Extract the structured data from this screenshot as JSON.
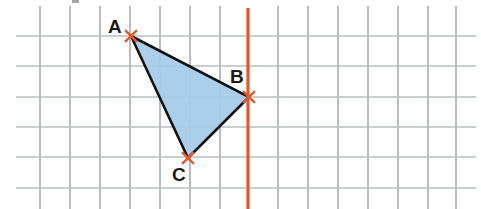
{
  "figure": {
    "canvas": {
      "width": 481,
      "height": 209,
      "background": "#ffffff"
    },
    "grid": {
      "cell_size": 30,
      "origin_x": 40,
      "origin_y": 36,
      "color_vertical": "#b9bcc0",
      "color_horizontal": "#c9ced1",
      "line_width": 1.1,
      "vertical_x": [
        40,
        70,
        100,
        130,
        160,
        190,
        220,
        278,
        308,
        338,
        368,
        398,
        428,
        456
      ],
      "horizontal_y": [
        36,
        66,
        97,
        127,
        157,
        188
      ],
      "h_extent": [
        16,
        476
      ],
      "v_extent": [
        6,
        209
      ]
    },
    "mirror_line": {
      "label": "mirror-line",
      "x": 248,
      "y_start": 8,
      "y_end": 209,
      "color": "#e8562a",
      "width": 3.2
    },
    "triangle": {
      "fill": "#a7cbe9",
      "fill_opacity": 0.95,
      "stroke": "#111111",
      "stroke_width": 2.6,
      "vertices": [
        {
          "name": "A",
          "x": 131,
          "y": 36,
          "label_x": 108,
          "label_y": 33
        },
        {
          "name": "B",
          "x": 249,
          "y": 97,
          "label_x": 230,
          "label_y": 83
        },
        {
          "name": "C",
          "x": 188,
          "y": 158,
          "label_x": 172,
          "label_y": 181
        }
      ]
    },
    "vertex_markers": {
      "color": "#e8562a",
      "size": 5.2,
      "stroke_width": 2.4
    },
    "smudge": {
      "x": 72,
      "y": 0,
      "width": 7,
      "height": 3,
      "color": "#5a5a5a"
    },
    "labels": {
      "a": "A",
      "b": "B",
      "c": "C"
    }
  },
  "chart_data": {
    "type": "scatter",
    "xlabel": "",
    "ylabel": "",
    "grid": true,
    "legend": null,
    "annotations": [
      "A",
      "B",
      "C"
    ],
    "points": [
      {
        "label": "A",
        "x": 131,
        "y": 36
      },
      {
        "label": "B",
        "x": 249,
        "y": 97
      },
      {
        "label": "C",
        "x": 188,
        "y": 158
      }
    ],
    "shapes": [
      {
        "type": "polygon",
        "name": "triangle-ABC",
        "points": "A,B,C",
        "fill": "#a7cbe9",
        "stroke": "#111111"
      },
      {
        "type": "vline",
        "name": "mirror-line",
        "x": 248,
        "color": "#e8562a"
      }
    ],
    "grid_spacing": 30
  }
}
